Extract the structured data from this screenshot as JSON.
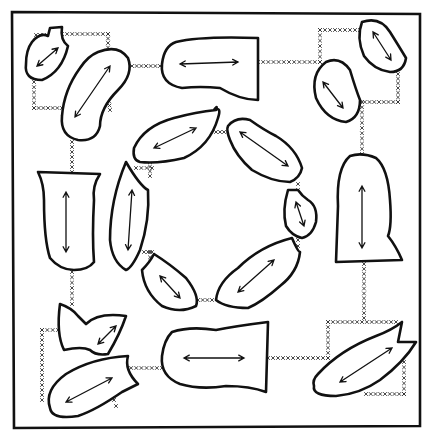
{
  "diagram": {
    "title": "",
    "colors": {
      "line": "#111111",
      "stitch": "#333333",
      "background": "#ffffff"
    },
    "frame": "M12 12 L420 14 L420 426 L14 428 Z",
    "pieces": [
      {
        "id": "tl-small",
        "d": "M32 42 Q40 32 48 36 L50 28 L62 27 Q60 40 68 46 Q62 72 42 80 Q24 80 26 64 Q26 50 32 42 Z",
        "arrow": [
          37,
          66,
          58,
          48,
          "both"
        ]
      },
      {
        "id": "tl-bean",
        "d": "M98 52 Q118 44 128 58 Q134 74 118 90 Q100 108 100 126 Q96 142 78 140 Q60 136 62 116 Q64 90 80 68 Q88 56 98 52 Z",
        "arrow": [
          75,
          117,
          110,
          66,
          "both"
        ]
      },
      {
        "id": "top-bell",
        "d": "M176 42 Q200 36 258 38 L258 100 Q240 100 220 88 Q200 86 182 88 Q160 84 162 64 Q164 46 176 42 Z",
        "arrow": [
          180,
          64,
          238,
          62,
          "both"
        ]
      },
      {
        "id": "tr-small",
        "d": "M362 22 Q380 16 390 32 Q400 48 406 58 Q404 72 390 72 Q374 70 364 56 Q356 38 362 22 Z",
        "arrow": [
          373,
          32,
          391,
          60,
          "both"
        ]
      },
      {
        "id": "tr-mid",
        "d": "M326 62 Q340 56 350 70 Q356 90 360 100 Q360 118 346 122 Q326 120 316 98 Q310 74 326 62 Z",
        "arrow": [
          323,
          82,
          343,
          108,
          "both"
        ]
      },
      {
        "id": "left-cup",
        "d": "M38 172 L100 174 Q92 186 94 200 Q92 236 94 262 Q88 270 74 270 Q60 270 50 258 Q44 240 44 200 Q44 184 38 172 Z",
        "arrow": [
          66,
          192,
          66,
          252,
          "both"
        ]
      },
      {
        "id": "left-long",
        "d": "M126 162 Q140 186 148 190 Q150 220 140 250 Q132 268 126 270 Q112 262 110 240 Q110 200 126 162 Z",
        "arrow": [
          132,
          190,
          128,
          250,
          "both"
        ]
      },
      {
        "id": "right-bell",
        "d": "M350 156 Q362 152 376 158 Q388 168 390 200 Q392 226 388 236 Q396 246 402 260 L336 262 L338 206 Q336 168 350 156 Z",
        "arrow": [
          362,
          186,
          362,
          248,
          "both"
        ]
      },
      {
        "id": "ring-top-left",
        "d": "M134 148 Q144 126 174 118 Q196 112 216 110 Q218 104 214 110 Q222 106 218 118 Q210 146 184 158 Q158 164 140 162 Q132 160 134 148 Z",
        "arrow": [
          154,
          148,
          196,
          128,
          "both"
        ]
      },
      {
        "id": "ring-top-right",
        "d": "M228 126 Q236 116 250 120 Q264 130 276 136 Q296 148 302 168 Q300 178 290 182 Q272 182 252 170 Q236 156 230 140 Q226 130 228 126 Z",
        "arrow": [
          240,
          132,
          288,
          166,
          "both"
        ]
      },
      {
        "id": "ring-right-small",
        "d": "M288 190 L298 190 Q302 196 308 200 Q318 206 316 222 Q312 236 302 238 Q292 236 286 226 Q282 210 288 190 Z",
        "arrow": [
          296,
          202,
          304,
          226,
          "both"
        ]
      },
      {
        "id": "ring-bottom-left",
        "d": "M142 270 Q150 262 154 254 Q170 264 186 278 Q200 296 196 306 Q180 314 162 306 Q144 292 142 270 Z",
        "arrow": [
          160,
          276,
          180,
          298,
          "both"
        ]
      },
      {
        "id": "ring-bottom-right",
        "d": "M238 268 Q260 246 292 238 Q298 252 300 252 Q298 272 280 286 Q262 302 248 308 Q226 308 216 300 Q218 282 238 268 Z",
        "arrow": [
          238,
          292,
          274,
          260,
          "both"
        ]
      },
      {
        "id": "bl-fish",
        "d": "M60 304 Q72 308 78 316 L86 324 Q98 312 126 316 Q120 334 108 354 Q96 356 90 350 Q82 346 64 350 Q56 334 60 304 Z",
        "arrow": [
          98,
          344,
          116,
          326,
          "both"
        ]
      },
      {
        "id": "bl-leaf",
        "d": "M50 408 Q44 390 66 374 Q92 358 128 356 Q124 370 138 384 L122 392 Q96 410 78 416 Q52 420 50 408 Z",
        "arrow": [
          66,
          402,
          112,
          378,
          "both"
        ]
      },
      {
        "id": "bottom-bell",
        "d": "M172 332 Q190 326 216 330 Q236 326 268 322 L266 392 Q250 386 226 386 Q200 390 180 384 Q160 376 162 356 Q164 340 172 332 Z",
        "arrow": [
          184,
          358,
          244,
          358,
          "both"
        ]
      },
      {
        "id": "br-leaf",
        "d": "M318 374 Q340 350 376 336 Q392 330 402 322 L398 342 L416 342 Q404 362 380 380 Q360 394 336 396 Q312 396 314 386 Q312 380 318 374 Z",
        "arrow": [
          340,
          382,
          392,
          348,
          "both"
        ]
      }
    ],
    "stitches": [
      {
        "x1": 36,
        "y1": 35,
        "x2": 44,
        "y2": 35
      },
      {
        "x1": 62,
        "y1": 34,
        "x2": 108,
        "y2": 34
      },
      {
        "x1": 108,
        "y1": 34,
        "x2": 108,
        "y2": 52
      },
      {
        "x1": 34,
        "y1": 82,
        "x2": 34,
        "y2": 108
      },
      {
        "x1": 34,
        "y1": 108,
        "x2": 62,
        "y2": 108
      },
      {
        "x1": 108,
        "y1": 92,
        "x2": 110,
        "y2": 110
      },
      {
        "x1": 132,
        "y1": 66,
        "x2": 160,
        "y2": 66
      },
      {
        "x1": 258,
        "y1": 62,
        "x2": 320,
        "y2": 62
      },
      {
        "x1": 320,
        "y1": 30,
        "x2": 320,
        "y2": 62
      },
      {
        "x1": 320,
        "y1": 30,
        "x2": 360,
        "y2": 30
      },
      {
        "x1": 398,
        "y1": 74,
        "x2": 398,
        "y2": 102
      },
      {
        "x1": 360,
        "y1": 102,
        "x2": 398,
        "y2": 102
      },
      {
        "x1": 362,
        "y1": 102,
        "x2": 362,
        "y2": 154
      },
      {
        "x1": 72,
        "y1": 142,
        "x2": 72,
        "y2": 172
      },
      {
        "x1": 136,
        "y1": 168,
        "x2": 152,
        "y2": 168
      },
      {
        "x1": 150,
        "y1": 162,
        "x2": 150,
        "y2": 176
      },
      {
        "x1": 216,
        "y1": 132,
        "x2": 224,
        "y2": 132
      },
      {
        "x1": 298,
        "y1": 184,
        "x2": 298,
        "y2": 190
      },
      {
        "x1": 298,
        "y1": 240,
        "x2": 298,
        "y2": 246
      },
      {
        "x1": 144,
        "y1": 252,
        "x2": 152,
        "y2": 252
      },
      {
        "x1": 150,
        "y1": 252,
        "x2": 150,
        "y2": 268
      },
      {
        "x1": 198,
        "y1": 300,
        "x2": 212,
        "y2": 300
      },
      {
        "x1": 72,
        "y1": 272,
        "x2": 72,
        "y2": 304
      },
      {
        "x1": 42,
        "y1": 330,
        "x2": 58,
        "y2": 330
      },
      {
        "x1": 42,
        "y1": 330,
        "x2": 42,
        "y2": 400
      },
      {
        "x1": 126,
        "y1": 368,
        "x2": 162,
        "y2": 368
      },
      {
        "x1": 114,
        "y1": 400,
        "x2": 116,
        "y2": 406
      },
      {
        "x1": 268,
        "y1": 358,
        "x2": 328,
        "y2": 358
      },
      {
        "x1": 328,
        "y1": 322,
        "x2": 328,
        "y2": 358
      },
      {
        "x1": 328,
        "y1": 322,
        "x2": 396,
        "y2": 322
      },
      {
        "x1": 364,
        "y1": 264,
        "x2": 364,
        "y2": 318
      },
      {
        "x1": 404,
        "y1": 362,
        "x2": 404,
        "y2": 394
      },
      {
        "x1": 366,
        "y1": 394,
        "x2": 404,
        "y2": 394
      }
    ]
  }
}
